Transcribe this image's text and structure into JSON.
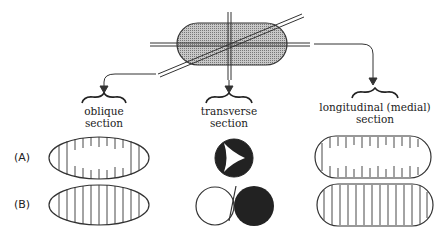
{
  "diagram": {
    "object": "rod-shaped cell with cutting planes",
    "sections": [
      {
        "id": "oblique",
        "line1": "oblique",
        "line2": "section"
      },
      {
        "id": "transverse",
        "line1": "transverse",
        "line2": "section"
      },
      {
        "id": "longitudinal",
        "line1": "longitudinal (medial)",
        "line2": "section"
      }
    ],
    "rows": [
      {
        "label": "(A)"
      },
      {
        "label": "(B)"
      }
    ],
    "colors": {
      "ink": "#333333",
      "fill_dark": "#222222",
      "fill_shaded": "#aaaaaa"
    }
  }
}
